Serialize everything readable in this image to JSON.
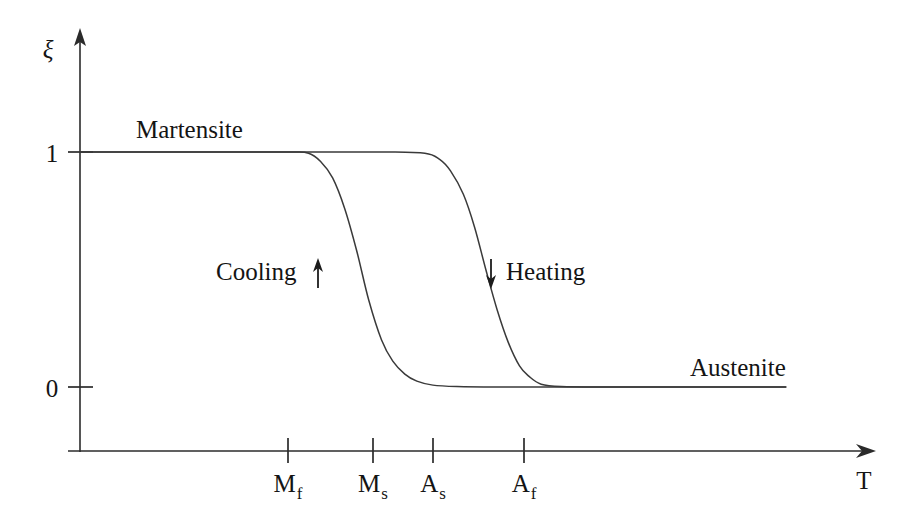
{
  "figure": {
    "background_color": "#ffffff",
    "ink_color": "#2b2b2b",
    "curve_color": "#3a3a3a"
  },
  "axes": {
    "y_axis_label": "ξ",
    "x_axis_label": "T",
    "y_ticks": [
      {
        "label": "1",
        "value": 1
      },
      {
        "label": "0",
        "value": 0
      }
    ],
    "x_ticks": [
      {
        "base": "M",
        "sub": "f",
        "name": "martensite-finish"
      },
      {
        "base": "M",
        "sub": "s",
        "name": "martensite-start"
      },
      {
        "base": "A",
        "sub": "s",
        "name": "austenite-start"
      },
      {
        "base": "A",
        "sub": "f",
        "name": "austenite-finish"
      }
    ]
  },
  "annotations": {
    "martensite_label": "Martensite",
    "austenite_label": "Austenite",
    "cooling_label": "Cooling",
    "heating_label": "Heating",
    "cooling_arrow_direction": "up",
    "heating_arrow_direction": "down"
  },
  "chart_data": {
    "type": "line",
    "xlabel": "T",
    "ylabel": "ξ",
    "xlim": [
      0,
      1
    ],
    "ylim": [
      0,
      1
    ],
    "grid": false,
    "legend": "none",
    "x_tick_labels": [
      "M_f",
      "M_s",
      "A_s",
      "A_f"
    ],
    "x_tick_positions": [
      0.264,
      0.376,
      0.455,
      0.575
    ],
    "y_tick_labels": [
      "1",
      "0"
    ],
    "y_tick_values": [
      1,
      0
    ],
    "series": [
      {
        "name": "Cooling",
        "description": "Austenite to martensite transformation on cooling; xi rises from 0 to 1 as temperature drops from M_s to M_f",
        "direction": "right-to-left",
        "transition_start_label": "M_s",
        "transition_end_label": "M_f",
        "x": [
          0.0,
          0.1,
          0.2,
          0.264,
          0.285,
          0.3,
          0.315,
          0.33,
          0.345,
          0.36,
          0.376,
          0.39,
          0.405,
          0.42,
          0.44,
          0.47,
          0.52,
          0.6,
          0.7,
          0.8,
          0.88
        ],
        "y": [
          1.0,
          1.0,
          1.0,
          1.0,
          0.995,
          0.96,
          0.89,
          0.76,
          0.58,
          0.37,
          0.2,
          0.11,
          0.055,
          0.025,
          0.008,
          0.002,
          0.0,
          0.0,
          0.0,
          0.0,
          0.0
        ]
      },
      {
        "name": "Heating",
        "description": "Martensite to austenite transformation on heating; xi falls from 1 to 0 as temperature rises from A_s to A_f",
        "direction": "left-to-right",
        "transition_start_label": "A_s",
        "transition_end_label": "A_f",
        "x": [
          0.0,
          0.1,
          0.2,
          0.3,
          0.38,
          0.43,
          0.448,
          0.462,
          0.478,
          0.492,
          0.506,
          0.52,
          0.534,
          0.548,
          0.56,
          0.575,
          0.6,
          0.66,
          0.74,
          0.82,
          0.88
        ],
        "y": [
          1.0,
          1.0,
          1.0,
          1.0,
          1.0,
          0.995,
          0.97,
          0.92,
          0.82,
          0.68,
          0.5,
          0.33,
          0.19,
          0.09,
          0.045,
          0.012,
          0.002,
          0.0,
          0.0,
          0.0,
          0.0
        ]
      }
    ],
    "annotations": [
      {
        "text": "Martensite",
        "x": 0.07,
        "y": 1.06
      },
      {
        "text": "Austenite",
        "x": 0.76,
        "y": 0.09
      },
      {
        "text": "Cooling",
        "x": 0.27,
        "y": 0.5
      },
      {
        "text": "Heating",
        "x": 0.55,
        "y": 0.5
      }
    ]
  }
}
